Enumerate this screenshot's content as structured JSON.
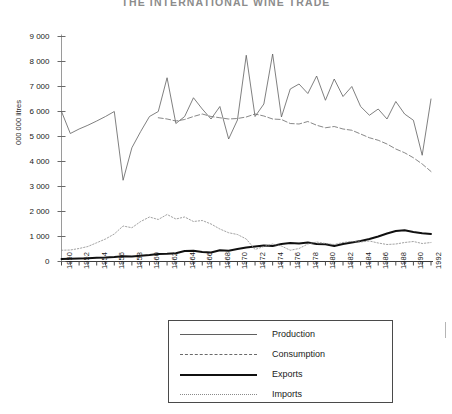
{
  "title": "THE INTERNATIONAL WINE TRADE",
  "axis": {
    "y_title": "000 000 litres",
    "y_ticks": [
      "0",
      "1 000",
      "2 000",
      "3 000",
      "4 000",
      "5 000",
      "6 000",
      "7 000",
      "8 000",
      "9 000"
    ],
    "x_ticks": [
      "1950",
      "1952",
      "1954",
      "1956",
      "1958",
      "1960",
      "1962",
      "1964",
      "1966",
      "1968",
      "1970",
      "1972",
      "1974",
      "1976",
      "1978",
      "1980",
      "1982",
      "1984",
      "1986",
      "1988",
      "1990",
      "1992"
    ]
  },
  "legend": {
    "items": [
      {
        "label": "Production",
        "style": "thin-solid",
        "color": "#5f5f5f",
        "icon": "line-sample-icon"
      },
      {
        "label": "Consumption",
        "style": "dashed",
        "color": "#6a6a6a",
        "icon": "line-sample-icon"
      },
      {
        "label": "Exports",
        "style": "thick-solid",
        "color": "#101010",
        "icon": "line-sample-icon"
      },
      {
        "label": "Imports",
        "style": "dotted",
        "color": "#8a8a8a",
        "icon": "line-sample-icon"
      }
    ]
  },
  "chart_data": {
    "type": "line",
    "title": "THE INTERNATIONAL WINE TRADE",
    "xlabel": "",
    "ylabel": "000 000 litres",
    "ylim": [
      0,
      9000
    ],
    "ytick_step": 1000,
    "xlim": [
      1950,
      1992
    ],
    "grid": false,
    "legend_position": "bottom-center",
    "x": [
      1950,
      1951,
      1952,
      1953,
      1954,
      1955,
      1956,
      1957,
      1958,
      1959,
      1960,
      1961,
      1962,
      1963,
      1964,
      1965,
      1966,
      1967,
      1968,
      1969,
      1970,
      1971,
      1972,
      1973,
      1974,
      1975,
      1976,
      1977,
      1978,
      1979,
      1980,
      1981,
      1982,
      1983,
      1984,
      1985,
      1986,
      1987,
      1988,
      1989,
      1990,
      1991,
      1992
    ],
    "series": [
      {
        "name": "Production",
        "style": "thin-solid",
        "color": "#5f5f5f",
        "values": [
          6000,
          5120,
          5300,
          5450,
          5620,
          5800,
          6000,
          3250,
          4550,
          5200,
          5800,
          6000,
          7350,
          5520,
          5800,
          6550,
          6100,
          5700,
          6200,
          4900,
          5660,
          8250,
          5800,
          6300,
          8300,
          5780,
          6900,
          7100,
          6720,
          7420,
          6450,
          7300,
          6600,
          7000,
          6200,
          5850,
          6100,
          5700,
          6400,
          5900,
          5650,
          4250,
          6500
        ]
      },
      {
        "name": "Consumption",
        "style": "dashed",
        "color": "#6a6a6a",
        "values": [
          null,
          null,
          null,
          null,
          null,
          null,
          null,
          null,
          null,
          null,
          null,
          5750,
          5700,
          5620,
          5680,
          5800,
          5900,
          5800,
          5750,
          5700,
          5720,
          5780,
          5900,
          5820,
          5700,
          5680,
          5520,
          5500,
          5600,
          5450,
          5350,
          5400,
          5300,
          5250,
          5100,
          4950,
          4850,
          4700,
          4500,
          4350,
          4150,
          3900,
          3600
        ]
      },
      {
        "name": "Exports",
        "style": "thick-solid",
        "color": "#101010",
        "values": [
          100,
          110,
          120,
          130,
          150,
          160,
          180,
          210,
          200,
          230,
          260,
          300,
          310,
          330,
          420,
          430,
          380,
          360,
          450,
          430,
          500,
          560,
          600,
          640,
          620,
          700,
          740,
          720,
          760,
          700,
          690,
          620,
          700,
          760,
          820,
          900,
          1000,
          1120,
          1220,
          1250,
          1180,
          1130,
          1100
        ]
      },
      {
        "name": "Imports",
        "style": "dotted",
        "color": "#8a8a8a",
        "values": [
          450,
          460,
          520,
          600,
          750,
          900,
          1100,
          1420,
          1350,
          1600,
          1780,
          1680,
          1880,
          1700,
          1780,
          1600,
          1640,
          1500,
          1300,
          1150,
          1080,
          900,
          480,
          600,
          700,
          620,
          450,
          520,
          700,
          780,
          720,
          680,
          760,
          800,
          780,
          820,
          740,
          680,
          700,
          760,
          800,
          720,
          760
        ]
      }
    ]
  }
}
